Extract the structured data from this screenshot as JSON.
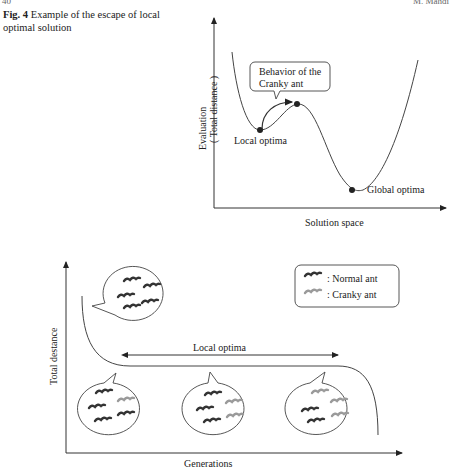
{
  "page": {
    "number_left": "40",
    "running_head_right": "M. Mahdi"
  },
  "caption": {
    "label": "Fig. 4",
    "text": "Example of the escape of local optimal solution"
  },
  "top_diagram": {
    "y_axis_label_line1": "Evaluation",
    "y_axis_label_line2": "( Total distance )",
    "x_axis_label": "Solution space",
    "callout": [
      "Behavior of the",
      "Cranky ant"
    ],
    "points": {
      "local": "Local optima",
      "global": "Global optima"
    }
  },
  "bottom_diagram": {
    "y_axis_label": "Total destance",
    "x_axis_label": "Generations",
    "range_label": "Local optima",
    "legend": [
      {
        "label": ": Normal ant",
        "color": "#333333"
      },
      {
        "label": ": Cranky ant",
        "color": "#9a9a9a"
      }
    ],
    "bubbles": [
      {
        "position": "start",
        "normal": 5,
        "cranky": 0
      },
      {
        "position": "early",
        "normal": 4,
        "cranky": 1
      },
      {
        "position": "middle",
        "normal": 3,
        "cranky": 2
      },
      {
        "position": "late",
        "normal": 2,
        "cranky": 3
      }
    ]
  }
}
